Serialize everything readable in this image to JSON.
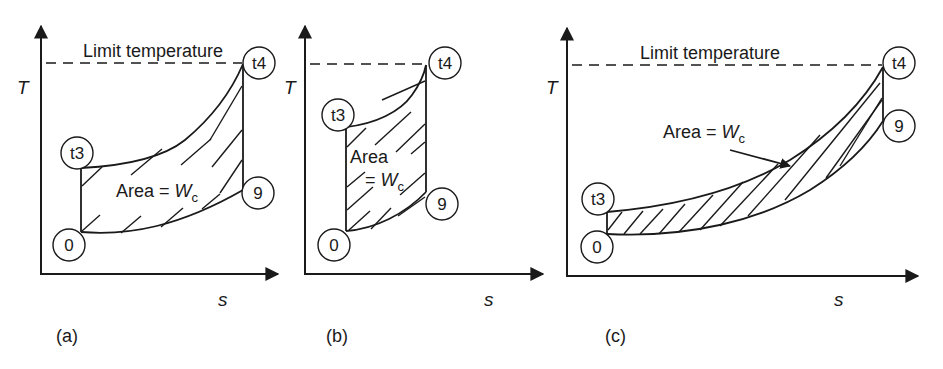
{
  "figure": {
    "type": "T-s diagrams",
    "colors": {
      "ink": "#1a1a1a",
      "background": "#ffffff"
    },
    "panels": [
      {
        "id": "a",
        "label": "(a)",
        "y_axis_label": "T",
        "x_axis_label": "s",
        "limit_line_label": "Limit temperature",
        "area_label_main": "Area = ",
        "area_label_var": "W",
        "area_label_sub": "c",
        "points": {
          "t3": "t3",
          "t4": "t4",
          "p0": "0",
          "p9": "9"
        }
      },
      {
        "id": "b",
        "label": "(b)",
        "y_axis_label": "T",
        "x_axis_label": "s",
        "area_label_line1": "Area",
        "area_label_main": "= ",
        "area_label_var": "W",
        "area_label_sub": "c",
        "points": {
          "t3": "t3",
          "t4": "t4",
          "p0": "0",
          "p9": "9"
        }
      },
      {
        "id": "c",
        "label": "(c)",
        "y_axis_label": "T",
        "x_axis_label": "s",
        "limit_line_label": "Limit temperature",
        "area_label_main": "Area = ",
        "area_label_var": "W",
        "area_label_sub": "c",
        "points": {
          "t3": "t3",
          "t4": "t4",
          "p0": "0",
          "p9": "9"
        }
      }
    ]
  }
}
